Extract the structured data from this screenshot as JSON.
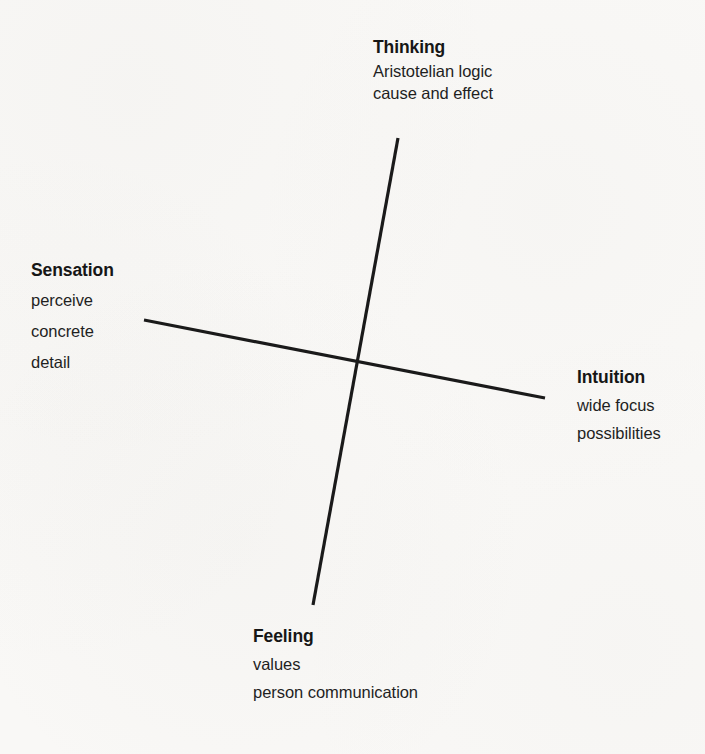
{
  "diagram": {
    "background_color": "#f9f8f6",
    "line_color": "#1a1a1a",
    "text_color": "#1c1c1c",
    "line_width_px": 3,
    "crossing_point": {
      "x": 357,
      "y": 362
    },
    "axes": [
      {
        "name": "thinking-feeling-axis",
        "from_pole": "Thinking",
        "to_pole": "Feeling",
        "x1": 398,
        "y1": 138,
        "x2": 313,
        "y2": 605
      },
      {
        "name": "sensation-intuition-axis",
        "from_pole": "Sensation",
        "to_pole": "Intuition",
        "x1": 144,
        "y1": 320,
        "x2": 545,
        "y2": 398
      }
    ],
    "poles": {
      "thinking": {
        "title": "Thinking",
        "lines": [
          "Aristotelian logic",
          "cause and effect"
        ]
      },
      "sensation": {
        "title": "Sensation",
        "lines": [
          "perceive",
          "concrete",
          "detail"
        ]
      },
      "intuition": {
        "title": "Intuition",
        "lines": [
          "wide focus",
          "possibilities"
        ]
      },
      "feeling": {
        "title": "Feeling",
        "lines": [
          "values",
          "person communication"
        ]
      }
    }
  }
}
